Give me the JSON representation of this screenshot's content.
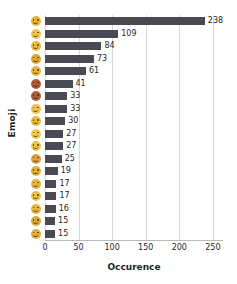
{
  "chart_data": {
    "type": "bar",
    "orientation": "horizontal",
    "title": "",
    "xlabel": "Occurence",
    "ylabel": "Emoji",
    "xlim": [
      0,
      265
    ],
    "xticks": [
      0,
      50,
      100,
      150,
      200,
      250
    ],
    "grid": "vertical",
    "legend": "none",
    "bar_color": "#4a4a52",
    "categories": [
      "emoji-face-1",
      "emoji-face-2",
      "emoji-face-3",
      "emoji-face-4",
      "emoji-face-5",
      "emoji-face-6",
      "emoji-face-7",
      "emoji-face-8",
      "emoji-face-9",
      "emoji-face-10",
      "emoji-face-11",
      "emoji-face-12",
      "emoji-face-13",
      "emoji-face-14",
      "emoji-face-15",
      "emoji-face-16",
      "emoji-face-17",
      "emoji-face-18"
    ],
    "category_colors": [
      "#e8b53a",
      "#f0c64a",
      "#e9bb3e",
      "#d9a736",
      "#e7b63d",
      "#b05a3a",
      "#a8603c",
      "#edc24a",
      "#e9bc40",
      "#efc850",
      "#eec34a",
      "#d8a23c",
      "#e3b03c",
      "#e6b53f",
      "#eec04a",
      "#e5b340",
      "#dba93c",
      "#e2ae3e"
    ],
    "values": [
      238,
      109,
      84,
      73,
      61,
      41,
      33,
      33,
      30,
      27,
      27,
      25,
      19,
      17,
      17,
      16,
      15,
      15
    ],
    "value_labels": [
      "238",
      "109",
      "84",
      "73",
      "61",
      "41",
      "33",
      "33",
      "30",
      "27",
      "27",
      "25",
      "19",
      "17",
      "17",
      "16",
      "15",
      "15"
    ]
  }
}
